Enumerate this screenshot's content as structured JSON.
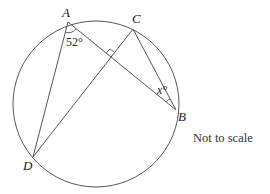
{
  "diagram": {
    "type": "circle-theorem",
    "points": {
      "A": {
        "label": "A",
        "x": 68,
        "y": 22
      },
      "C": {
        "label": "C",
        "x": 133,
        "y": 29
      },
      "B": {
        "label": "B",
        "x": 176,
        "y": 110
      },
      "D": {
        "label": "D",
        "x": 33,
        "y": 157
      }
    },
    "circle": {
      "cx": 96,
      "cy": 104,
      "r": 83
    },
    "segments": [
      "AD",
      "AB",
      "CD",
      "CB"
    ],
    "angles": {
      "A": {
        "label": "52°",
        "between": "DAB"
      },
      "B": {
        "label": "x°",
        "between": "CBA"
      }
    },
    "right_angle": "intersection of AB and CD",
    "note": "Not to scale"
  }
}
